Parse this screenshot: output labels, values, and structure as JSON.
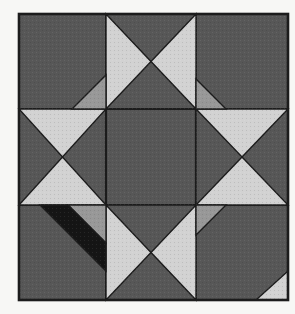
{
  "image": {
    "description": "Scanned diagram of a pieced quilt block (Ohio Star variation) in shades of gray",
    "background_color": "#f7f7f5"
  },
  "block": {
    "border": {
      "x": 19,
      "y": 14,
      "width": 269,
      "height": 286,
      "stroke_width": 2.6
    },
    "colors": {
      "dark": "#575757",
      "medium": "#989898",
      "light": "#d2d2d2",
      "black": "#151515",
      "seam": "#1c1c1c"
    },
    "patches": [
      {
        "name": "cell-top-left",
        "color": "dark",
        "points": [
          [
            19,
            14
          ],
          [
            106,
            14
          ],
          [
            106,
            109
          ],
          [
            19,
            109
          ]
        ]
      },
      {
        "name": "cell-top-middle",
        "color": "dark",
        "points": [
          [
            106,
            14
          ],
          [
            196,
            14
          ],
          [
            196,
            109
          ],
          [
            106,
            109
          ]
        ]
      },
      {
        "name": "cell-top-right",
        "color": "dark",
        "points": [
          [
            196,
            14
          ],
          [
            288,
            14
          ],
          [
            288,
            109
          ],
          [
            196,
            109
          ]
        ]
      },
      {
        "name": "cell-middle-left",
        "color": "dark",
        "points": [
          [
            19,
            109
          ],
          [
            106,
            109
          ],
          [
            106,
            205
          ],
          [
            19,
            205
          ]
        ]
      },
      {
        "name": "cell-center",
        "color": "dark",
        "points": [
          [
            106,
            109
          ],
          [
            196,
            109
          ],
          [
            196,
            205
          ],
          [
            106,
            205
          ]
        ],
        "stroke": 2.2
      },
      {
        "name": "cell-middle-right",
        "color": "dark",
        "points": [
          [
            196,
            109
          ],
          [
            288,
            109
          ],
          [
            288,
            205
          ],
          [
            196,
            205
          ]
        ]
      },
      {
        "name": "cell-bottom-left",
        "color": "dark",
        "points": [
          [
            19,
            205
          ],
          [
            106,
            205
          ],
          [
            106,
            300
          ],
          [
            19,
            300
          ]
        ]
      },
      {
        "name": "cell-bottom-middle",
        "color": "dark",
        "points": [
          [
            106,
            205
          ],
          [
            196,
            205
          ],
          [
            196,
            300
          ],
          [
            106,
            300
          ]
        ]
      },
      {
        "name": "cell-bottom-right",
        "color": "dark",
        "points": [
          [
            196,
            205
          ],
          [
            288,
            205
          ],
          [
            288,
            300
          ],
          [
            196,
            300
          ]
        ]
      },
      {
        "name": "star-point-top-middle-left",
        "color": "light",
        "points": [
          [
            106,
            14
          ],
          [
            106,
            109
          ],
          [
            151,
            61.5
          ]
        ]
      },
      {
        "name": "star-point-top-middle-right",
        "color": "light",
        "points": [
          [
            196,
            14
          ],
          [
            196,
            109
          ],
          [
            151,
            61.5
          ]
        ]
      },
      {
        "name": "star-point-middle-left-top",
        "color": "light",
        "points": [
          [
            19,
            109
          ],
          [
            106,
            109
          ],
          [
            62.5,
            157
          ]
        ]
      },
      {
        "name": "star-point-middle-left-bottom",
        "color": "light",
        "points": [
          [
            19,
            205
          ],
          [
            106,
            205
          ],
          [
            62.5,
            157
          ]
        ]
      },
      {
        "name": "star-point-middle-right-top",
        "color": "light",
        "points": [
          [
            196,
            109
          ],
          [
            288,
            109
          ],
          [
            242,
            157
          ]
        ]
      },
      {
        "name": "star-point-middle-right-bottom",
        "color": "light",
        "points": [
          [
            196,
            205
          ],
          [
            288,
            205
          ],
          [
            242,
            157
          ]
        ]
      },
      {
        "name": "star-point-bottom-middle-left",
        "color": "light",
        "points": [
          [
            106,
            205
          ],
          [
            106,
            300
          ],
          [
            151,
            252.5
          ]
        ]
      },
      {
        "name": "star-point-bottom-middle-right",
        "color": "light",
        "points": [
          [
            196,
            205
          ],
          [
            196,
            300
          ],
          [
            151,
            252.5
          ]
        ]
      },
      {
        "name": "corner-triangle-top-left-cell",
        "color": "medium",
        "points": [
          [
            106,
            109
          ],
          [
            106,
            75
          ],
          [
            72,
            109
          ]
        ]
      },
      {
        "name": "corner-triangle-top-right-cell",
        "color": "medium",
        "points": [
          [
            196,
            109
          ],
          [
            196,
            79
          ],
          [
            226,
            109
          ]
        ]
      },
      {
        "name": "corner-triangle-bottom-left-cell",
        "color": "medium",
        "points": [
          [
            106,
            205
          ],
          [
            68,
            205
          ],
          [
            106,
            243
          ]
        ]
      },
      {
        "name": "corner-triangle-bottom-right-cell",
        "color": "medium",
        "points": [
          [
            196,
            205
          ],
          [
            226,
            205
          ],
          [
            196,
            235
          ]
        ]
      },
      {
        "name": "black-band-bottom-left-cell",
        "color": "black",
        "points": [
          [
            40,
            205
          ],
          [
            68,
            205
          ],
          [
            106,
            243
          ],
          [
            106,
            271
          ]
        ]
      },
      {
        "name": "light-corner-triangle-bottom-right",
        "color": "light",
        "points": [
          [
            288,
            300
          ],
          [
            256,
            300
          ],
          [
            288,
            271
          ]
        ]
      }
    ]
  }
}
